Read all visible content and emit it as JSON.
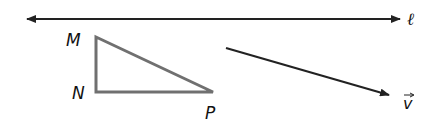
{
  "colors": {
    "line": "#222222",
    "triangle": "#707070",
    "text": "#111111",
    "background": "#ffffff"
  },
  "line": {
    "label": "ℓ",
    "x1": 27,
    "y1": 19,
    "x2": 400,
    "y2": 19,
    "arrows": "both"
  },
  "triangle": {
    "vertices": [
      {
        "name": "M",
        "x": 96,
        "y": 37
      },
      {
        "name": "N",
        "x": 96,
        "y": 92
      },
      {
        "name": "P",
        "x": 213,
        "y": 92
      }
    ],
    "labels": {
      "M": "M",
      "N": "N",
      "P": "P"
    }
  },
  "vector": {
    "label": "v",
    "arrow_glyph": "→",
    "x1": 226,
    "y1": 48,
    "x2": 389,
    "y2": 96
  }
}
